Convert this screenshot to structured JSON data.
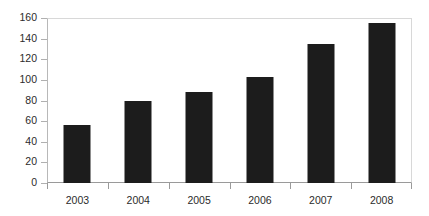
{
  "chart_data": {
    "type": "bar",
    "title": "",
    "subtitle": "",
    "xlabel": "",
    "ylabel": "",
    "categories": [
      "2003",
      "2004",
      "2005",
      "2006",
      "2007",
      "2008"
    ],
    "values": [
      56,
      80,
      88,
      103,
      135,
      155
    ],
    "series": [
      {
        "name": "",
        "values": [
          56,
          80,
          88,
          103,
          135,
          155
        ]
      }
    ],
    "ylim": [
      0,
      160
    ],
    "ytick_step": 20,
    "yticks": [
      0,
      20,
      40,
      60,
      80,
      100,
      120,
      140,
      160
    ],
    "ytick_labels": [
      "0",
      "20",
      "40",
      "60",
      "80",
      "100",
      "120",
      "140",
      "160"
    ],
    "grid": false,
    "legend": false,
    "legend_position": "none",
    "annotations": [],
    "colors": {
      "bar": "#1c1c1c",
      "axis": "#9a9a9a",
      "tick_mark": "#b0b0b0",
      "plot_border": "#d8d8d8",
      "text": "#2b2b2b",
      "background": "#ffffff"
    }
  }
}
